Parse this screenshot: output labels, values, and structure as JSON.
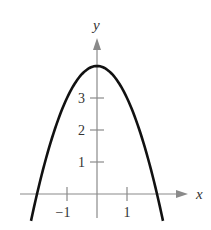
{
  "chart_data": {
    "type": "line",
    "title": "",
    "function": "y = 4 - x^2",
    "xlabel": "x",
    "ylabel": "y",
    "x_ticks": [
      -1,
      1
    ],
    "x_tick_labels": [
      "−1",
      "1"
    ],
    "y_ticks": [
      1,
      2,
      3
    ],
    "y_tick_labels": [
      "1",
      "2",
      "3"
    ],
    "xlim": [
      -2.1,
      2.9
    ],
    "ylim": [
      -0.8,
      5.0
    ],
    "grid": false,
    "legend": null,
    "series": [
      {
        "name": "parabola",
        "x": [
          -2.2,
          -2.0,
          -1.5,
          -1.0,
          -0.5,
          0.0,
          0.5,
          1.0,
          1.5,
          2.0,
          2.2
        ],
        "y": [
          -0.84,
          0.0,
          1.75,
          3.0,
          3.75,
          4.0,
          3.75,
          3.0,
          1.75,
          0.0,
          -0.84
        ]
      }
    ],
    "colors": {
      "curve": "#111111",
      "axis": "#888888",
      "text": "#333333"
    }
  }
}
